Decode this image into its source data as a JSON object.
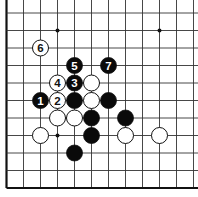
{
  "diagram": {
    "type": "go-board-fragment",
    "board": {
      "origin_x": 6.5,
      "origin_y": 13,
      "spacing_x": 17.0,
      "spacing_y": 17.5,
      "cols": 12,
      "rows": 11,
      "left_edge": true,
      "bottom_edge": true,
      "top_edge": false,
      "right_edge": false,
      "line_color": "#333333",
      "edge_color": "#111111",
      "background": "#ffffff"
    },
    "star_points": [
      {
        "col": 3,
        "row": 1
      },
      {
        "col": 9,
        "row": 1
      },
      {
        "col": 3,
        "row": 7
      }
    ],
    "stones": [
      {
        "col": 2,
        "row": 5,
        "color": "black",
        "label": "1"
      },
      {
        "col": 3,
        "row": 5,
        "color": "white",
        "label": "2"
      },
      {
        "col": 4,
        "row": 4,
        "color": "black",
        "label": "3"
      },
      {
        "col": 3,
        "row": 4,
        "color": "white",
        "label": "4"
      },
      {
        "col": 4,
        "row": 3,
        "color": "black",
        "label": "5"
      },
      {
        "col": 2,
        "row": 2,
        "color": "white",
        "label": "6"
      },
      {
        "col": 6,
        "row": 3,
        "color": "black",
        "label": "7"
      },
      {
        "col": 4,
        "row": 5,
        "color": "black",
        "label": ""
      },
      {
        "col": 6,
        "row": 5,
        "color": "black",
        "label": ""
      },
      {
        "col": 5,
        "row": 6,
        "color": "black",
        "label": ""
      },
      {
        "col": 7,
        "row": 6,
        "color": "black",
        "label": ""
      },
      {
        "col": 5,
        "row": 7,
        "color": "black",
        "label": ""
      },
      {
        "col": 4,
        "row": 8,
        "color": "black",
        "label": ""
      },
      {
        "col": 5,
        "row": 4,
        "color": "white",
        "label": ""
      },
      {
        "col": 5,
        "row": 5,
        "color": "white",
        "label": ""
      },
      {
        "col": 3,
        "row": 6,
        "color": "white",
        "label": ""
      },
      {
        "col": 4,
        "row": 6,
        "color": "white",
        "label": ""
      },
      {
        "col": 2,
        "row": 7,
        "color": "white",
        "label": ""
      },
      {
        "col": 7,
        "row": 7,
        "color": "white",
        "label": ""
      },
      {
        "col": 9,
        "row": 7,
        "color": "white",
        "label": ""
      }
    ]
  }
}
